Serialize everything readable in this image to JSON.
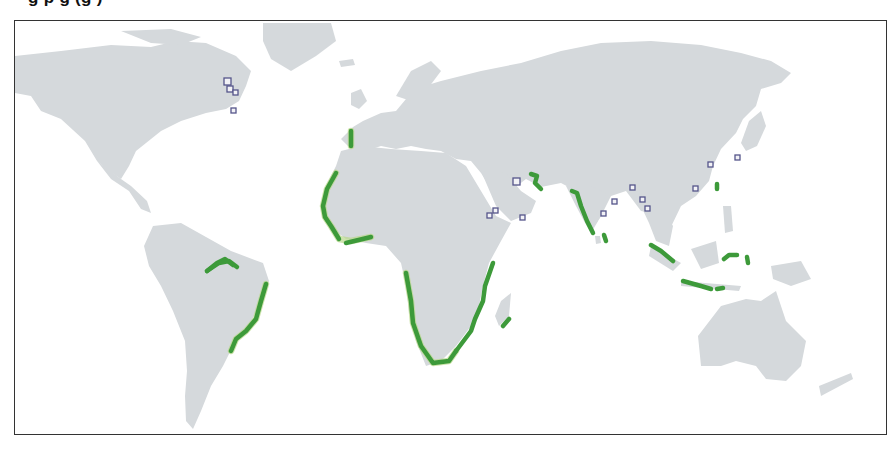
{
  "title": {
    "visible_fragments": "g  p g  (g )",
    "note_cropped": true
  },
  "map": {
    "colors": {
      "land": "#d5d9dc",
      "water": "#ffffff",
      "coastline_highlight": "#3d9a3a",
      "marker_outline": "#55558a",
      "frame": "#333333"
    },
    "legend_classes": [
      {
        "id": "highlighted-coast",
        "color": "#3d9a3a",
        "shape": "coastline band"
      },
      {
        "id": "site-marker",
        "color": "#55558a",
        "shape": "square"
      }
    ],
    "markers": [
      {
        "region": "north-america-east",
        "x": 226,
        "y": 80,
        "size": 7
      },
      {
        "region": "north-america-east",
        "x": 229,
        "y": 88,
        "size": 6
      },
      {
        "region": "north-america-east",
        "x": 234,
        "y": 92,
        "size": 5
      },
      {
        "region": "north-america-east",
        "x": 232,
        "y": 110,
        "size": 5
      },
      {
        "region": "persian-gulf",
        "x": 515,
        "y": 180,
        "size": 7
      },
      {
        "region": "red-sea",
        "x": 488,
        "y": 214,
        "size": 5
      },
      {
        "region": "red-sea",
        "x": 494,
        "y": 209,
        "size": 5
      },
      {
        "region": "gulf-of-aden",
        "x": 521,
        "y": 216,
        "size": 5
      },
      {
        "region": "bay-of-bengal",
        "x": 602,
        "y": 212,
        "size": 5
      },
      {
        "region": "bay-of-bengal",
        "x": 613,
        "y": 200,
        "size": 5
      },
      {
        "region": "bay-of-bengal",
        "x": 631,
        "y": 186,
        "size": 5
      },
      {
        "region": "bay-of-bengal",
        "x": 641,
        "y": 198,
        "size": 5
      },
      {
        "region": "bay-of-bengal",
        "x": 646,
        "y": 207,
        "size": 5
      },
      {
        "region": "south-china-coast",
        "x": 694,
        "y": 187,
        "size": 5
      },
      {
        "region": "east-china-coast",
        "x": 709,
        "y": 163,
        "size": 5
      },
      {
        "region": "korea-japan",
        "x": 736,
        "y": 156,
        "size": 5
      }
    ],
    "highlighted_coasts": [
      "portugal-west-coast",
      "west-africa-coast",
      "gulf-of-guinea",
      "southern-africa-coast",
      "east-africa-coast",
      "madagascar-south",
      "amazon-mouth",
      "brazil-east-coast",
      "persian-gulf-strait-of-hormuz",
      "india-west-coast",
      "sri-lanka",
      "sumatra",
      "java-lesser-sunda",
      "sulawesi",
      "maluku",
      "taiwan"
    ]
  }
}
